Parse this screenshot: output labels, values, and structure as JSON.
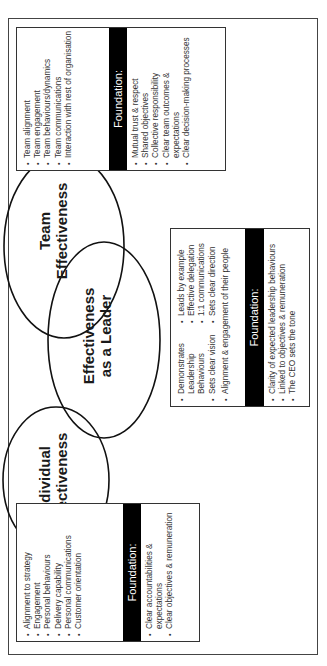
{
  "circles": {
    "individual": {
      "line1": "Individual",
      "line2": "Effectiveness"
    },
    "team": {
      "line1": "Team",
      "line2": "Effectiveness"
    },
    "leader": {
      "line1": "Effectiveness",
      "line2": "as a Leader"
    }
  },
  "team_box": {
    "items": [
      "Team alignment",
      "Team engagement",
      "Team behaviours/dynamics",
      "Team communications",
      "Interaction with rest of organisation"
    ],
    "foundation_label": "Foundation:",
    "foundation_items": [
      "Mutual trust & respect",
      "Shared objectives",
      "Collective responsibility",
      "Clear team outcomes & expectations",
      "Clear decision-making processes"
    ]
  },
  "individual_box": {
    "items": [
      "Alignment to strategy",
      "Engagement",
      "Personal behaviours",
      "Delivery capability",
      "Personal communications",
      "Customer orientation"
    ],
    "foundation_label": "Foundation:",
    "foundation_items": [
      "Clear accountabilities & expectations",
      "Clear objectives & remuneration"
    ]
  },
  "leader_box": {
    "left_items": [
      "Demonstrates Leadership Behaviours",
      "Sets clear vision"
    ],
    "right_items": [
      "Leads by example",
      "Effective delegation",
      "1:1 communications",
      "Sets clear direction"
    ],
    "full_items": [
      "Alignment & engagement of their people"
    ],
    "foundation_label": "Foundation:",
    "foundation_items": [
      "Clarity of expected leadership behaviours",
      "Linked to objectives & remuneration",
      "The CEO sets the tone"
    ]
  }
}
